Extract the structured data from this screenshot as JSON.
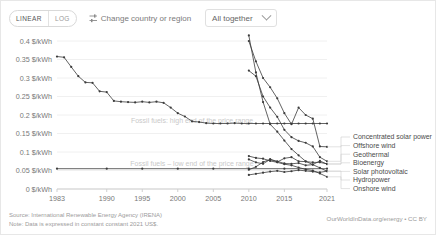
{
  "toolbar": {
    "scale_options": [
      "LINEAR",
      "LOG"
    ],
    "scale_selected": "LINEAR",
    "change_region_label": "Change country or region",
    "change_region_icon": "filter-icon",
    "selector_value": "All together",
    "selector_icon": "chevron-down-icon"
  },
  "footer": {
    "source": "Source: International Renewable Energy Agency (IRENA)",
    "note": "Note: Data is expressed in constant constant 2021 US$.",
    "attribution": "OurWorldInData.org/energy • CC BY"
  },
  "chart_data": {
    "type": "line",
    "title": "",
    "xlabel": "",
    "ylabel": "$/kWh",
    "xlim": [
      1983,
      2021
    ],
    "ylim": [
      0,
      0.4
    ],
    "grid": true,
    "legend_position": "right",
    "ytick_labels": [
      "0 $/kWh",
      "0.05 $/kWh",
      "0.1 $/kWh",
      "0.15 $/kWh",
      "0.2 $/kWh",
      "0.25 $/kWh",
      "0.3 $/kWh",
      "0.35 $/kWh",
      "0.4 $/kWh"
    ],
    "ytick_values": [
      0,
      0.05,
      0.1,
      0.15,
      0.2,
      0.25,
      0.3,
      0.35,
      0.4
    ],
    "xtick_labels": [
      "1983",
      "1990",
      "1995",
      "2000",
      "2005",
      "2010",
      "2015",
      "2021"
    ],
    "xtick_values": [
      1983,
      1990,
      1995,
      2000,
      2005,
      2010,
      2015,
      2021
    ],
    "annotations": [
      {
        "text": "Fossil fuels: high end of the price range",
        "x": 2002,
        "y": 0.178
      },
      {
        "text": "Fossil fuels – low end of the price range",
        "x": 2002,
        "y": 0.062
      }
    ],
    "series": [
      {
        "name": "Concentrated solar power",
        "x": [
          2010,
          2011,
          2012,
          2013,
          2014,
          2015,
          2016,
          2017,
          2018,
          2019,
          2020,
          2021
        ],
        "values": [
          0.4,
          0.345,
          0.3,
          0.275,
          0.245,
          0.205,
          0.175,
          0.22,
          0.2,
          0.19,
          0.115,
          0.114
        ]
      },
      {
        "name": "Offshore wind",
        "x": [
          2010,
          2011,
          2012,
          2013,
          2014,
          2015,
          2016,
          2017,
          2018,
          2019,
          2020,
          2021
        ],
        "values": [
          0.32,
          0.305,
          0.25,
          0.22,
          0.195,
          0.16,
          0.14,
          0.13,
          0.125,
          0.115,
          0.086,
          0.075
        ]
      },
      {
        "name": "Geothermal",
        "x": [
          2010,
          2011,
          2012,
          2013,
          2014,
          2015,
          2016,
          2017,
          2018,
          2019,
          2020,
          2021
        ],
        "values": [
          0.052,
          0.06,
          0.073,
          0.08,
          0.073,
          0.083,
          0.086,
          0.075,
          0.074,
          0.072,
          0.072,
          0.068
        ]
      },
      {
        "name": "Bioenergy",
        "x": [
          2010,
          2011,
          2012,
          2013,
          2014,
          2015,
          2016,
          2017,
          2018,
          2019,
          2020,
          2021
        ],
        "values": [
          0.08,
          0.072,
          0.068,
          0.08,
          0.075,
          0.069,
          0.068,
          0.07,
          0.064,
          0.066,
          0.076,
          0.067
        ]
      },
      {
        "name": "Solar photovoltaic",
        "x": [
          2010,
          2011,
          2012,
          2013,
          2014,
          2015,
          2016,
          2017,
          2018,
          2019,
          2020,
          2021
        ],
        "values": [
          0.415,
          0.315,
          0.235,
          0.175,
          0.155,
          0.131,
          0.108,
          0.091,
          0.075,
          0.066,
          0.057,
          0.048
        ]
      },
      {
        "name": "Hydropower",
        "x": [
          2010,
          2011,
          2012,
          2013,
          2014,
          2015,
          2016,
          2017,
          2018,
          2019,
          2020,
          2021
        ],
        "values": [
          0.038,
          0.041,
          0.044,
          0.047,
          0.049,
          0.046,
          0.048,
          0.051,
          0.049,
          0.047,
          0.045,
          0.048
        ]
      },
      {
        "name": "Onshore wind",
        "x": [
          2010,
          2011,
          2012,
          2013,
          2014,
          2015,
          2016,
          2017,
          2018,
          2019,
          2020,
          2021
        ],
        "values": [
          0.089,
          0.084,
          0.082,
          0.076,
          0.072,
          0.067,
          0.064,
          0.058,
          0.053,
          0.05,
          0.042,
          0.033
        ]
      },
      {
        "name": "Fossil fuels: high end of the price range",
        "x": [
          1983,
          1984,
          1985,
          1986,
          1987,
          1988,
          1989,
          1990,
          1991,
          1992,
          1993,
          1994,
          1995,
          1996,
          1997,
          1998,
          1999,
          2000,
          2001,
          2002,
          2003,
          2004,
          2005,
          2006,
          2007,
          2008,
          2009,
          2010,
          2011,
          2012,
          2013,
          2014,
          2015,
          2016,
          2017,
          2018,
          2019,
          2020,
          2021
        ],
        "values": [
          0.358,
          0.356,
          0.33,
          0.305,
          0.288,
          0.287,
          0.264,
          0.262,
          0.238,
          0.236,
          0.235,
          0.234,
          0.236,
          0.234,
          0.236,
          0.233,
          0.22,
          0.205,
          0.196,
          0.183,
          0.181,
          0.178,
          0.177,
          0.177,
          0.177,
          0.178,
          0.177,
          0.177,
          0.177,
          0.177,
          0.177,
          0.177,
          0.177,
          0.177,
          0.177,
          0.177,
          0.177,
          0.177,
          0.177
        ]
      },
      {
        "name": "Fossil fuels – low end of the price range",
        "x": [
          1983,
          1990,
          1995,
          2000,
          2005,
          2010,
          2015,
          2021
        ],
        "values": [
          0.055,
          0.055,
          0.055,
          0.055,
          0.055,
          0.055,
          0.055,
          0.055
        ]
      }
    ],
    "legend": [
      "Concentrated solar power",
      "Offshore wind",
      "Geothermal",
      "Bioenergy",
      "Solar photovoltaic",
      "Hydropower",
      "Onshore wind"
    ]
  }
}
